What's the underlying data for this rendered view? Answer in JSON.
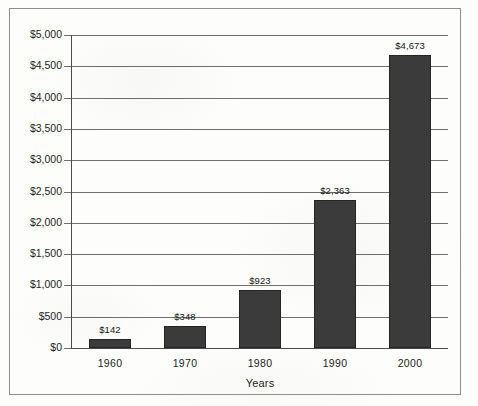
{
  "chart_data": {
    "type": "bar",
    "title": "",
    "subtitle": "",
    "xlabel": "Years",
    "ylabel": "",
    "categories": [
      "1960",
      "1970",
      "1980",
      "1990",
      "2000"
    ],
    "values": [
      142,
      348,
      923,
      2363,
      4673
    ],
    "data_labels": [
      "$142",
      "$348",
      "$923",
      "$2,363",
      "$4,673"
    ],
    "ylim": [
      0,
      5000
    ],
    "ytick_step": 500,
    "ytick_labels": [
      "$0",
      "$500",
      "$1,000",
      "$1,500",
      "$2,000",
      "$2,500",
      "$3,000",
      "$3,500",
      "$4,000",
      "$4,500",
      "$5,000"
    ],
    "ytick_values": [
      0,
      500,
      1000,
      1500,
      2000,
      2500,
      3000,
      3500,
      4000,
      4500,
      5000
    ],
    "grid": true,
    "grid_axis": "y",
    "legend": false,
    "legend_position": "none",
    "series": [
      {
        "name": "",
        "values": [
          142,
          348,
          923,
          2363,
          4673
        ],
        "color": "#3b3b3b"
      }
    ],
    "colors": {
      "bar_fill": "#3b3b3b",
      "gridline": "#6e6e6e",
      "axis": "#4a4a4a",
      "text": "#1d1d1d",
      "frame": "#8d8d8d",
      "background": "#fdfdfc"
    }
  }
}
